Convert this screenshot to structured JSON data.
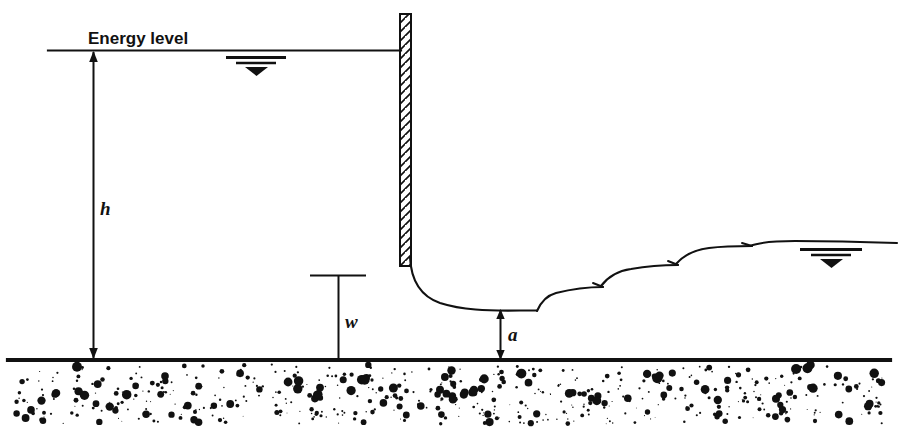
{
  "figure": {
    "labels": {
      "energy_level": "Energy level",
      "head_h": "h",
      "gate_opening_w": "w",
      "jet_depth_a": "a"
    },
    "colors": {
      "ink": "#111111",
      "background": "#ffffff"
    }
  },
  "elements": {
    "energy_line": {
      "name": "energy-level-line",
      "y": 50,
      "x_start": 48,
      "x_end": 401
    },
    "ground_line": {
      "name": "ground-line",
      "y": 360,
      "x_start": 8,
      "x_end": 890
    },
    "gate": {
      "name": "sluice-gate",
      "x": 400,
      "y_top": 14,
      "width": 11,
      "y_bottom": 266,
      "hatch": "diagonal"
    },
    "dim_h": {
      "name": "dimension-h",
      "x": 93,
      "y_top": 51,
      "y_bottom": 358,
      "arrows": "both"
    },
    "dim_w": {
      "name": "dimension-w",
      "x": 338,
      "y_top": 275,
      "y_bottom": 360,
      "tick_x_start": 310,
      "tick_x_end": 366
    },
    "dim_a": {
      "name": "dimension-a",
      "x": 500,
      "y_top": 310,
      "y_bottom": 358,
      "arrows": "both"
    },
    "upstream_water_symbol": {
      "name": "water-surface-symbol-upstream",
      "x": 252,
      "y": 53
    },
    "downstream_water_symbol": {
      "name": "water-surface-symbol-downstream",
      "x": 830,
      "y": 248
    },
    "jet_curve": {
      "name": "jet-profile",
      "from_x": 410,
      "from_y": 258,
      "vena_contracta_x": 520,
      "vena_contracta_y": 310
    },
    "hydraulic_jump": {
      "name": "undular-hydraulic-jump",
      "wave_count": 4,
      "x_start": 535,
      "x_end": 790,
      "y_start": 310,
      "y_end": 247
    },
    "soil": {
      "name": "soil-stipple",
      "y_top": 364,
      "y_bottom": 424
    }
  },
  "chart_data": {
    "type": "line",
    "xlabel": "",
    "ylabel": "",
    "annotations": [
      "Energy level",
      "h",
      "w",
      "a"
    ],
    "series": [
      {
        "name": "energy-level",
        "x": [
          48,
          401
        ],
        "y": [
          50,
          50
        ]
      },
      {
        "name": "ground-bed",
        "x": [
          8,
          890
        ],
        "y": [
          360,
          360
        ]
      },
      {
        "name": "jet-and-jump-surface",
        "x": [
          410,
          440,
          470,
          500,
          535,
          560,
          590,
          620,
          650,
          680,
          710,
          740,
          770,
          800,
          890
        ],
        "y": [
          258,
          286,
          302,
          309,
          310,
          296,
          288,
          290,
          276,
          268,
          270,
          256,
          249,
          247,
          247
        ]
      }
    ],
    "dimensions": [
      {
        "label": "h",
        "from_y": 50,
        "to_y": 360,
        "value_px": 310
      },
      {
        "label": "w",
        "from_y": 275,
        "to_y": 360,
        "value_px": 85
      },
      {
        "label": "a",
        "from_y": 310,
        "to_y": 360,
        "value_px": 50
      }
    ]
  }
}
